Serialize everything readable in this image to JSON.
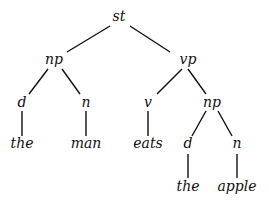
{
  "diagram": {
    "type": "parse-tree",
    "nodes": [
      {
        "id": "st",
        "label": "st",
        "x": 119,
        "y": 21
      },
      {
        "id": "np1",
        "label": "np",
        "x": 54,
        "y": 64
      },
      {
        "id": "vp",
        "label": "vp",
        "x": 188,
        "y": 64
      },
      {
        "id": "d1",
        "label": "d",
        "x": 22,
        "y": 107
      },
      {
        "id": "n1",
        "label": "n",
        "x": 86,
        "y": 107
      },
      {
        "id": "v",
        "label": "v",
        "x": 148,
        "y": 107
      },
      {
        "id": "np2",
        "label": "np",
        "x": 212,
        "y": 107
      },
      {
        "id": "the1",
        "label": "the",
        "x": 22,
        "y": 148
      },
      {
        "id": "man",
        "label": "man",
        "x": 86,
        "y": 148
      },
      {
        "id": "eats",
        "label": "eats",
        "x": 148,
        "y": 148
      },
      {
        "id": "d2",
        "label": "d",
        "x": 188,
        "y": 148
      },
      {
        "id": "n2",
        "label": "n",
        "x": 237,
        "y": 148
      },
      {
        "id": "the2",
        "label": "the",
        "x": 188,
        "y": 191
      },
      {
        "id": "apple",
        "label": "apple",
        "x": 237,
        "y": 191
      }
    ],
    "edges": [
      {
        "from": "st",
        "to": "np1",
        "x1": 110,
        "y1": 26,
        "x2": 67,
        "y2": 52
      },
      {
        "from": "st",
        "to": "vp",
        "x1": 130,
        "y1": 26,
        "x2": 170,
        "y2": 52
      },
      {
        "from": "np1",
        "to": "d1",
        "x1": 48,
        "y1": 69,
        "x2": 29,
        "y2": 94
      },
      {
        "from": "np1",
        "to": "n1",
        "x1": 62,
        "y1": 69,
        "x2": 80,
        "y2": 94
      },
      {
        "from": "vp",
        "to": "v",
        "x1": 182,
        "y1": 69,
        "x2": 157,
        "y2": 94
      },
      {
        "from": "vp",
        "to": "np2",
        "x1": 188,
        "y1": 69,
        "x2": 206,
        "y2": 94
      },
      {
        "from": "d1",
        "to": "the1",
        "x1": 22,
        "y1": 111,
        "x2": 22,
        "y2": 136
      },
      {
        "from": "n1",
        "to": "man",
        "x1": 86,
        "y1": 111,
        "x2": 86,
        "y2": 136
      },
      {
        "from": "v",
        "to": "eats",
        "x1": 148,
        "y1": 111,
        "x2": 148,
        "y2": 136
      },
      {
        "from": "np2",
        "to": "d2",
        "x1": 206,
        "y1": 111,
        "x2": 192,
        "y2": 136
      },
      {
        "from": "np2",
        "to": "n2",
        "x1": 218,
        "y1": 111,
        "x2": 232,
        "y2": 136
      },
      {
        "from": "d2",
        "to": "the2",
        "x1": 188,
        "y1": 154,
        "x2": 188,
        "y2": 178
      },
      {
        "from": "n2",
        "to": "apple",
        "x1": 237,
        "y1": 154,
        "x2": 237,
        "y2": 178
      }
    ]
  }
}
